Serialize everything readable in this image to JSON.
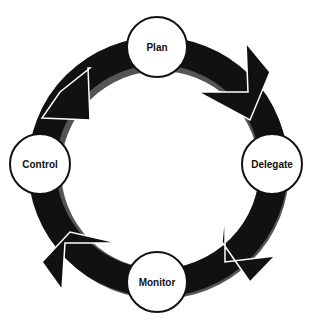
{
  "diagram": {
    "type": "cycle",
    "colors": {
      "ring": "#111111",
      "shadow": "#444444",
      "node_fill": "#ffffff",
      "node_border": "#111111"
    },
    "nodes": [
      {
        "label": "Plan"
      },
      {
        "label": "Delegate"
      },
      {
        "label": "Monitor"
      },
      {
        "label": "Control"
      }
    ],
    "flow": "clockwise"
  }
}
